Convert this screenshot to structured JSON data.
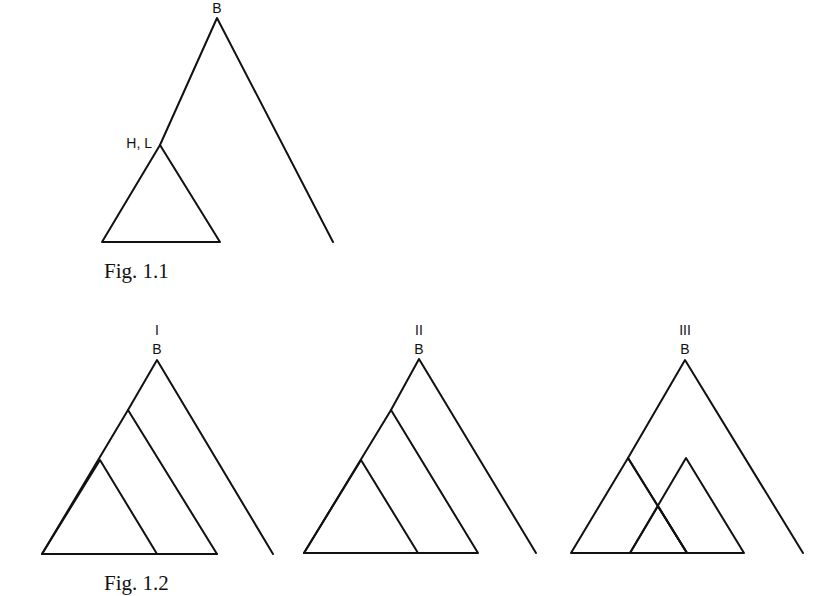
{
  "figures": [
    {
      "id": "fig-1-1",
      "caption": "Fig. 1.1",
      "root_label": "B",
      "subnode_label": "H, L",
      "regions": [
        {
          "name": "H,L clade",
          "pattern": "crosshatch"
        }
      ]
    },
    {
      "id": "fig-1-2",
      "caption": "Fig. 1.2",
      "panels": [
        {
          "numeral": "I",
          "root_label": "B",
          "regions": [
            {
              "name": "outer clade",
              "pattern": "vertical"
            },
            {
              "name": "inner clade",
              "pattern": "crosshatch"
            }
          ]
        },
        {
          "numeral": "II",
          "root_label": "B",
          "regions": [
            {
              "name": "outer clade",
              "pattern": "horizontal"
            },
            {
              "name": "inner clade",
              "pattern": "crosshatch"
            }
          ]
        },
        {
          "numeral": "III",
          "root_label": "B",
          "regions": [
            {
              "name": "left clade",
              "pattern": "horizontal"
            },
            {
              "name": "right clade",
              "pattern": "vertical"
            },
            {
              "name": "overlap",
              "pattern": "crosshatch"
            }
          ]
        }
      ]
    }
  ]
}
